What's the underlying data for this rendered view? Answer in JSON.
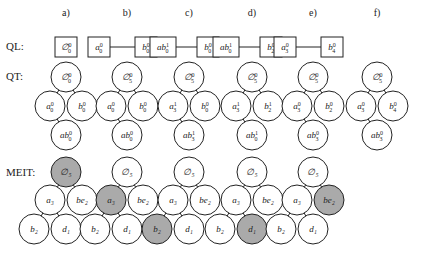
{
  "row_labels": {
    "ql": "QL:",
    "qt": "QT:",
    "meit": "MEIT:"
  },
  "colors": {
    "node_fill": "#ffffff",
    "highlight_fill": "#aaaaaa",
    "stroke": "#222222"
  },
  "columns": [
    {
      "header": "a)",
      "ql": [
        {
          "base": "∅",
          "sup": "0",
          "sub": "0"
        }
      ],
      "qt": {
        "root": {
          "base": "∅",
          "sup": "0",
          "sub": "0"
        },
        "left": {
          "base": "a",
          "sup": "0",
          "sub": "0"
        },
        "right": {
          "base": "b",
          "sup": "0",
          "sub": "0"
        },
        "bottom": {
          "base": "ab",
          "sup": "0",
          "sub": "0"
        }
      },
      "meit": {
        "root": "∅₅",
        "left": "a₃",
        "right": "be₂",
        "ll": "b₂",
        "lr": "d₁",
        "highlight": "root"
      }
    },
    {
      "header": "b)",
      "ql": [
        {
          "base": "a",
          "sup": "0",
          "sub": "0"
        },
        {
          "base": "b",
          "sup": "0",
          "sub": "0"
        }
      ],
      "qt": {
        "root": {
          "base": "∅",
          "sup": "0",
          "sub": "5"
        },
        "left": {
          "base": "a",
          "sup": "0",
          "sub": "0"
        },
        "right": {
          "base": "b",
          "sup": "0",
          "sub": "0"
        },
        "bottom": {
          "base": "ab",
          "sup": "0",
          "sub": "0"
        }
      },
      "meit": {
        "root": "∅₅",
        "left": "a₃",
        "right": "be₂",
        "ll": "b₂",
        "lr": "d₁",
        "highlight": "left"
      }
    },
    {
      "header": "c)",
      "ql": [
        {
          "base": "ab",
          "sup": "1",
          "sub": "0"
        },
        {
          "base": "b",
          "sup": "0",
          "sub": "0"
        }
      ],
      "qt": {
        "root": {
          "base": "∅",
          "sup": "0",
          "sub": "5"
        },
        "left": {
          "base": "a",
          "sup": "1",
          "sub": "3"
        },
        "right": {
          "base": "b",
          "sup": "0",
          "sub": "0"
        },
        "bottom": {
          "base": "ab",
          "sup": "1",
          "sub": "3"
        }
      },
      "meit": {
        "root": "∅₅",
        "left": "a₃",
        "right": "be₂",
        "ll": "b₂",
        "lr": "d₁",
        "highlight": "ll"
      }
    },
    {
      "header": "d)",
      "ql": [
        {
          "base": "ab",
          "sup": "1",
          "sub": "0"
        },
        {
          "base": "b",
          "sup": "0",
          "sub": "2"
        }
      ],
      "qt": {
        "root": {
          "base": "∅",
          "sup": "0",
          "sub": "5"
        },
        "left": {
          "base": "a",
          "sup": "1",
          "sub": "3"
        },
        "right": {
          "base": "b",
          "sup": "1",
          "sub": "2"
        },
        "bottom": {
          "base": "ab",
          "sup": "1",
          "sub": "0"
        }
      },
      "meit": {
        "root": "∅₅",
        "left": "a₃",
        "right": "be₂",
        "ll": "b₂",
        "lr": "d₁",
        "highlight": "lr"
      }
    },
    {
      "header": "e)",
      "ql": [
        {
          "base": "a",
          "sup": "0",
          "sub": "3"
        },
        {
          "base": "b",
          "sup": "0",
          "sub": "4"
        }
      ],
      "qt": {
        "root": {
          "base": "∅",
          "sup": "0",
          "sub": "5"
        },
        "left": {
          "base": "a",
          "sup": "0",
          "sub": "3"
        },
        "right": {
          "base": "b",
          "sup": "0",
          "sub": "2"
        },
        "bottom": {
          "base": "ab",
          "sup": "0",
          "sub": "3"
        }
      },
      "meit": {
        "root": "∅₅",
        "left": "a₃",
        "right": "be₂",
        "ll": "b₂",
        "lr": "d₁",
        "highlight": "right"
      }
    },
    {
      "header": "f)",
      "ql": [],
      "qt": {
        "root": {
          "base": "∅",
          "sup": "0",
          "sub": "5"
        },
        "left": {
          "base": "a",
          "sup": "0",
          "sub": "3"
        },
        "right": {
          "base": "b",
          "sup": "0",
          "sub": "4"
        },
        "bottom": {
          "base": "ab",
          "sup": "0",
          "sub": "3"
        }
      },
      "meit": null
    }
  ]
}
